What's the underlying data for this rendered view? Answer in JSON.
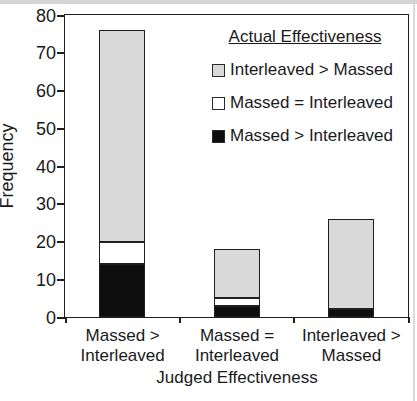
{
  "figure": {
    "background": "#ffffff",
    "frame_color": "#1f1f1f",
    "text_color": "#1a1a1a"
  },
  "chart_data": {
    "type": "bar",
    "subtype": "stacked-vertical",
    "title": "",
    "xlabel": "Judged Effectiveness",
    "ylabel": "Frequency",
    "ylim": [
      0,
      80
    ],
    "yticks": [
      0,
      10,
      20,
      30,
      40,
      50,
      60,
      70,
      80
    ],
    "grid": false,
    "categories": [
      "Massed > Interleaved",
      "Massed = Interleaved",
      "Interleaved > Massed"
    ],
    "category_label_lines": [
      [
        "Massed >",
        "Interleaved"
      ],
      [
        "Massed =",
        "Interleaved"
      ],
      [
        "Interleaved >",
        "Massed"
      ]
    ],
    "series": [
      {
        "name": "Massed > Interleaved",
        "color": "#0e0e0e",
        "values": [
          14,
          3,
          2
        ]
      },
      {
        "name": "Massed = Interleaved",
        "color": "#ffffff",
        "values": [
          6,
          2,
          0
        ]
      },
      {
        "name": "Interleaved > Massed",
        "color": "#d9d9d9",
        "values": [
          56,
          13,
          24
        ]
      }
    ],
    "stack_order": "bottom-to-top",
    "bar_totals": [
      76,
      18,
      26
    ],
    "legend": {
      "title": "Actual Effectiveness",
      "position": "top-right",
      "entries": [
        {
          "label": "Interleaved > Massed",
          "color": "#d9d9d9"
        },
        {
          "label": "Massed = Interleaved",
          "color": "#ffffff"
        },
        {
          "label": "Massed > Interleaved",
          "color": "#0e0e0e"
        }
      ]
    }
  }
}
